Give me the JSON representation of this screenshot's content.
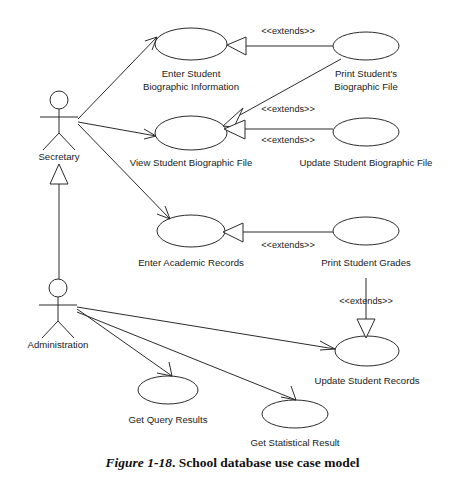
{
  "figure": {
    "number": "Figure 1-18",
    "separator": ".",
    "title": "School database use case model"
  },
  "diagram": {
    "type": "uml-use-case-diagram",
    "background_color": "#ffffff",
    "line_color": "#2b2b2b",
    "text_color": "#1a1a1a"
  },
  "actors": [
    {
      "id": "secretary",
      "label": "Secretary",
      "x": 59,
      "y": 100,
      "label_x": 59,
      "label_y": 157
    },
    {
      "id": "administration",
      "label": "Administration",
      "x": 58,
      "y": 288,
      "label_x": 58,
      "label_y": 345
    }
  ],
  "use_cases": [
    {
      "id": "enter-student-biographic-information",
      "label_line1": "Enter Student",
      "label_line2": "Biographic Information",
      "cx": 191,
      "cy": 44,
      "rx": 36,
      "ry": 16,
      "label_x": 191,
      "label_y1": 74,
      "label_y2": 87
    },
    {
      "id": "print-students-biographic-file",
      "label_line1": "Print Student's",
      "label_line2": "Biographic File",
      "cx": 366,
      "cy": 46,
      "rx": 33,
      "ry": 14,
      "label_x": 366,
      "label_y1": 74,
      "label_y2": 87
    },
    {
      "id": "view-student-biographic-file",
      "label_line1": "View Student Biographic File",
      "label_line2": "",
      "cx": 191,
      "cy": 133,
      "rx": 36,
      "ry": 17,
      "label_x": 191,
      "label_y1": 163,
      "label_y2": null
    },
    {
      "id": "update-student-biographic-file",
      "label_line1": "Update Student Biographic File",
      "label_line2": "",
      "cx": 366,
      "cy": 132,
      "rx": 33,
      "ry": 14,
      "label_x": 366,
      "label_y1": 163,
      "label_y2": null
    },
    {
      "id": "enter-academic-records",
      "label_line1": "Enter Academic Records",
      "label_line2": "",
      "cx": 191,
      "cy": 231,
      "rx": 34,
      "ry": 16,
      "label_x": 191,
      "label_y1": 263,
      "label_y2": null
    },
    {
      "id": "print-student-grades",
      "label_line1": "Print Student Grades",
      "label_line2": "",
      "cx": 366,
      "cy": 231,
      "rx": 33,
      "ry": 14,
      "label_x": 366,
      "label_y1": 263,
      "label_y2": null
    },
    {
      "id": "update-student-records",
      "label_line1": "Update Student Records",
      "label_line2": "",
      "cx": 367,
      "cy": 351,
      "rx": 32,
      "ry": 15,
      "label_x": 367,
      "label_y1": 381,
      "label_y2": null
    },
    {
      "id": "get-query-results",
      "label_line1": "Get Query Results",
      "label_line2": "",
      "cx": 168,
      "cy": 390,
      "rx": 30,
      "ry": 14,
      "label_x": 168,
      "label_y1": 420,
      "label_y2": null
    },
    {
      "id": "get-statistical-result",
      "label_line1": "Get Statistical Result",
      "label_line2": "",
      "cx": 295,
      "cy": 414,
      "rx": 33,
      "ry": 14,
      "label_x": 295,
      "label_y1": 443,
      "label_y2": null
    }
  ],
  "extend_labels": [
    {
      "id": "ext-1",
      "text": "<<extends>>",
      "x": 288,
      "y": 32
    },
    {
      "id": "ext-2",
      "text": "<<extends>>",
      "x": 288,
      "y": 110
    },
    {
      "id": "ext-3",
      "text": "<<extends>>",
      "x": 288,
      "y": 141
    },
    {
      "id": "ext-4",
      "text": "<<extends>>",
      "x": 288,
      "y": 246
    },
    {
      "id": "ext-5",
      "text": "<<extends>>",
      "x": 366,
      "y": 302
    }
  ],
  "relationships": [
    {
      "id": "secretary-to-enter-student-bio",
      "type": "association",
      "from": "secretary",
      "to": "enter-student-biographic-information"
    },
    {
      "id": "secretary-to-view-student-bio",
      "type": "association",
      "from": "secretary",
      "to": "view-student-biographic-file"
    },
    {
      "id": "secretary-to-enter-academic-records",
      "type": "association",
      "from": "secretary",
      "to": "enter-academic-records"
    },
    {
      "id": "administration-generalizes-secretary",
      "type": "generalization",
      "from": "administration",
      "to": "secretary"
    },
    {
      "id": "administration-to-update-student-records",
      "type": "association",
      "from": "administration",
      "to": "update-student-records"
    },
    {
      "id": "administration-to-get-query-results",
      "type": "association",
      "from": "administration",
      "to": "get-query-results"
    },
    {
      "id": "administration-to-get-statistical-result",
      "type": "association",
      "from": "administration",
      "to": "get-statistical-result"
    },
    {
      "id": "print-student-bio-extends-enter-student-bio",
      "type": "extends",
      "from": "print-students-biographic-file",
      "to": "enter-student-biographic-information",
      "label": "<<extends>>"
    },
    {
      "id": "print-student-bio-extends-view-student-bio",
      "type": "extends",
      "from": "print-students-biographic-file",
      "to": "view-student-biographic-file",
      "label": "<<extends>>"
    },
    {
      "id": "update-student-bio-extends-view-student-bio",
      "type": "extends",
      "from": "update-student-biographic-file",
      "to": "view-student-biographic-file",
      "label": "<<extends>>"
    },
    {
      "id": "print-student-grades-extends-enter-academic-records",
      "type": "extends",
      "from": "print-student-grades",
      "to": "enter-academic-records",
      "label": "<<extends>>"
    },
    {
      "id": "print-student-grades-extends-update-student-records",
      "type": "extends",
      "from": "print-student-grades",
      "to": "update-student-records",
      "label": "<<extends>>"
    }
  ]
}
